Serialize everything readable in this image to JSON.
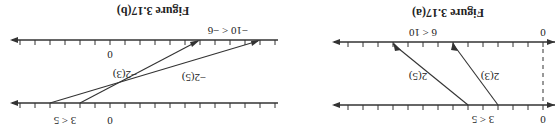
{
  "orientation": "rotated-180",
  "figures": [
    {
      "id": "a",
      "title": "Figure 3.17(a)",
      "bottom_line": {
        "zero_label": "0",
        "inequality": "3 < 5"
      },
      "top_line": {
        "zero_label": "0",
        "inequality": "6 < 10"
      },
      "arrows": [
        {
          "label": "2(3)",
          "from": 3,
          "to": 6
        },
        {
          "label": "2(5)",
          "from": 5,
          "to": 10
        }
      ],
      "unit_px": 15
    },
    {
      "id": "b",
      "title": "Figure 3.17(b)",
      "bottom_line": {
        "zero_label": "0",
        "inequality": "3 < 5"
      },
      "top_line": {
        "zero_label": "0",
        "inequality": "−10 < −6"
      },
      "arrows": [
        {
          "label": "−2(3)",
          "from": 3,
          "to": -6
        },
        {
          "label": "−2(5)",
          "from": 5,
          "to": -10
        }
      ],
      "unit_px": 15
    }
  ]
}
